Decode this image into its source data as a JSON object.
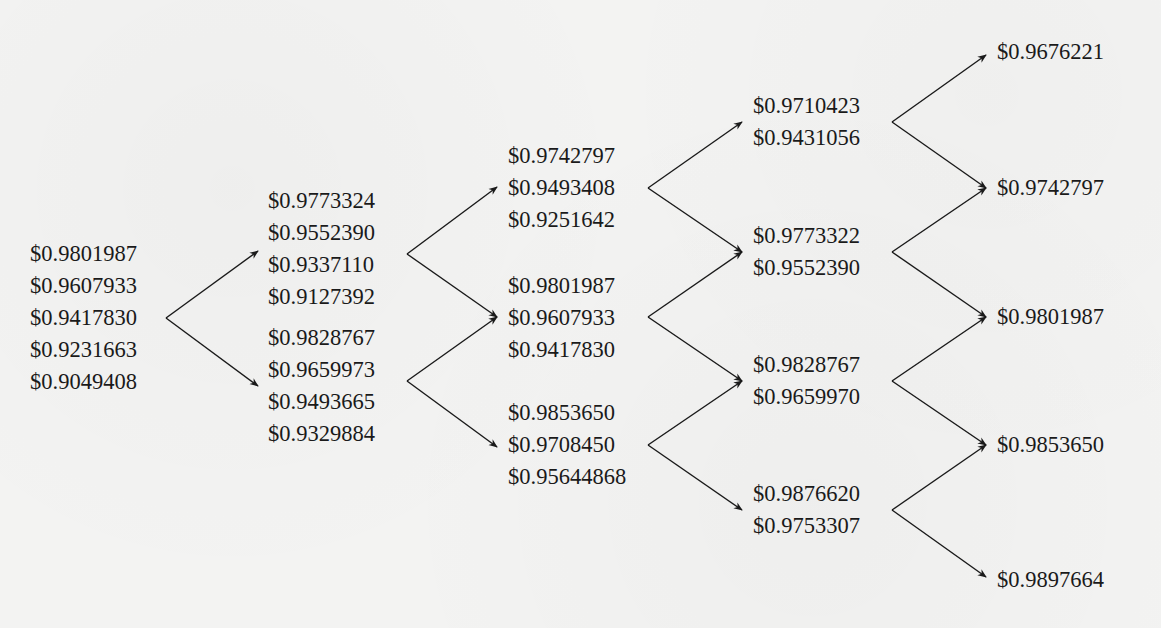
{
  "diagram": {
    "type": "binomial-tree",
    "columns": [
      {
        "step": 0,
        "nodes": [
          {
            "values": [
              "$0.9801987",
              "$0.9607933",
              "$0.9417830",
              "$0.9231663",
              "$0.9049408"
            ]
          }
        ]
      },
      {
        "step": 1,
        "nodes": [
          {
            "values": [
              "$0.9773324",
              "$0.9552390",
              "$0.9337110",
              "$0.9127392"
            ]
          },
          {
            "values": [
              "$0.9828767",
              "$0.9659973",
              "$0.9493665",
              "$0.9329884"
            ]
          }
        ]
      },
      {
        "step": 2,
        "nodes": [
          {
            "values": [
              "$0.9742797",
              "$0.9493408",
              "$0.9251642"
            ]
          },
          {
            "values": [
              "$0.9801987",
              "$0.9607933",
              "$0.9417830"
            ]
          },
          {
            "values": [
              "$0.9853650",
              "$0.9708450",
              "$0.95644868"
            ]
          }
        ]
      },
      {
        "step": 3,
        "nodes": [
          {
            "values": [
              "$0.9710423",
              "$0.9431056"
            ]
          },
          {
            "values": [
              "$0.9773322",
              "$0.9552390"
            ]
          },
          {
            "values": [
              "$0.9828767",
              "$0.9659970"
            ]
          },
          {
            "values": [
              "$0.9876620",
              "$0.9753307"
            ]
          }
        ]
      },
      {
        "step": 4,
        "nodes": [
          {
            "values": [
              "$0.9676221"
            ]
          },
          {
            "values": [
              "$0.9742797"
            ]
          },
          {
            "values": [
              "$0.9801987"
            ]
          },
          {
            "values": [
              "$0.9853650"
            ]
          },
          {
            "values": [
              "$0.9897664"
            ]
          }
        ]
      }
    ],
    "colors": {
      "background": "#f3f3f2",
      "text": "#1a1a1a",
      "arrow": "#1a1a1a"
    }
  }
}
